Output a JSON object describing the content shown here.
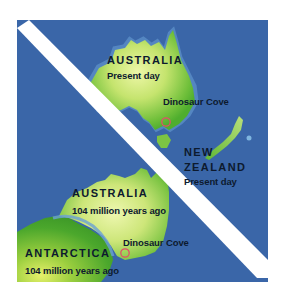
{
  "map": {
    "colors": {
      "ocean": "#3a66a8",
      "divider": "#ffffff",
      "land_light": "#e8f5a0",
      "land_dark": "#4fae2e",
      "shallow": "#6aa0d6",
      "marker": "#e0506a",
      "text": "#0d1a2e"
    },
    "present_day": {
      "australia": {
        "title": "AUSTRALIA",
        "subtitle": "Present day"
      },
      "new_zealand": {
        "title_line1": "NEW",
        "title_line2": "ZEALAND",
        "subtitle": "Present day"
      },
      "site": {
        "label": "Dinosaur Cove",
        "marker_icon": "circle-marker-icon"
      }
    },
    "past": {
      "australia": {
        "title": "AUSTRALIA",
        "subtitle": "104 million years ago"
      },
      "antarctica": {
        "title": "ANTARCTICA",
        "subtitle": "104 million years ago"
      },
      "site": {
        "label": "Dinosaur Cove",
        "marker_icon": "circle-marker-icon"
      }
    }
  }
}
